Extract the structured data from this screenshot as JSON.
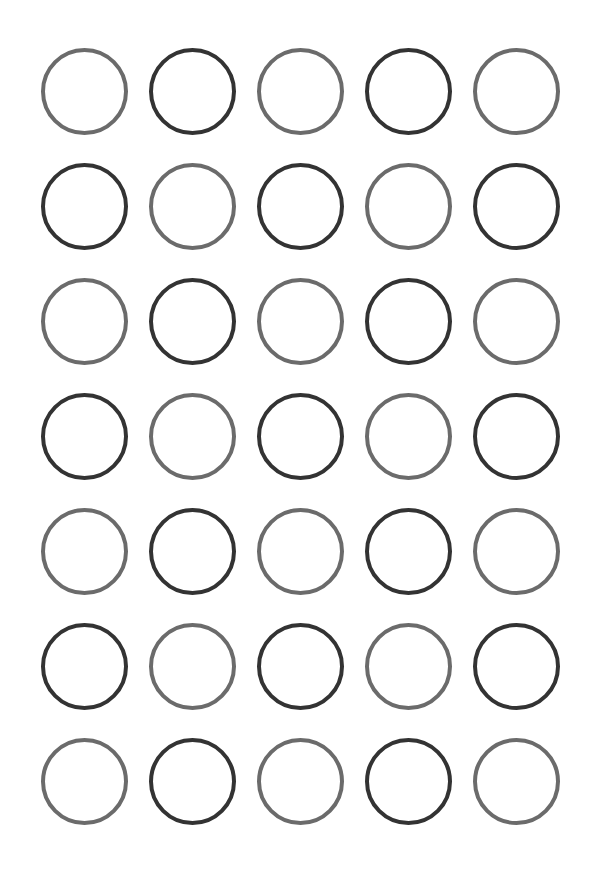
{
  "page": {
    "background_color": "#ffffff",
    "width": 613,
    "height": 878
  },
  "palette": {
    "gray": "#6b6b6b",
    "dark": "#333333",
    "background": "#ffffff"
  },
  "grid": {
    "rows": 7,
    "columns": 5,
    "total_circles": 35,
    "circle_diameter": 87,
    "stroke_width": 4,
    "column_pitch": 108,
    "row_pitch": 115,
    "offset_left": 30,
    "offset_top": 34,
    "pattern_name": "checkerboard-alternating",
    "cells": [
      {
        "row": 1,
        "col": 1,
        "tone": "gray",
        "color": "#6b6b6b",
        "label": "circle-r1c1"
      },
      {
        "row": 1,
        "col": 2,
        "tone": "dark",
        "color": "#333333",
        "label": "circle-r1c2"
      },
      {
        "row": 1,
        "col": 3,
        "tone": "gray",
        "color": "#6b6b6b",
        "label": "circle-r1c3"
      },
      {
        "row": 1,
        "col": 4,
        "tone": "dark",
        "color": "#333333",
        "label": "circle-r1c4"
      },
      {
        "row": 1,
        "col": 5,
        "tone": "gray",
        "color": "#6b6b6b",
        "label": "circle-r1c5"
      },
      {
        "row": 2,
        "col": 1,
        "tone": "dark",
        "color": "#333333",
        "label": "circle-r2c1"
      },
      {
        "row": 2,
        "col": 2,
        "tone": "gray",
        "color": "#6b6b6b",
        "label": "circle-r2c2"
      },
      {
        "row": 2,
        "col": 3,
        "tone": "dark",
        "color": "#333333",
        "label": "circle-r2c3"
      },
      {
        "row": 2,
        "col": 4,
        "tone": "gray",
        "color": "#6b6b6b",
        "label": "circle-r2c4"
      },
      {
        "row": 2,
        "col": 5,
        "tone": "dark",
        "color": "#333333",
        "label": "circle-r2c5"
      },
      {
        "row": 3,
        "col": 1,
        "tone": "gray",
        "color": "#6b6b6b",
        "label": "circle-r3c1"
      },
      {
        "row": 3,
        "col": 2,
        "tone": "dark",
        "color": "#333333",
        "label": "circle-r3c2"
      },
      {
        "row": 3,
        "col": 3,
        "tone": "gray",
        "color": "#6b6b6b",
        "label": "circle-r3c3"
      },
      {
        "row": 3,
        "col": 4,
        "tone": "dark",
        "color": "#333333",
        "label": "circle-r3c4"
      },
      {
        "row": 3,
        "col": 5,
        "tone": "gray",
        "color": "#6b6b6b",
        "label": "circle-r3c5"
      },
      {
        "row": 4,
        "col": 1,
        "tone": "dark",
        "color": "#333333",
        "label": "circle-r4c1"
      },
      {
        "row": 4,
        "col": 2,
        "tone": "gray",
        "color": "#6b6b6b",
        "label": "circle-r4c2"
      },
      {
        "row": 4,
        "col": 3,
        "tone": "dark",
        "color": "#333333",
        "label": "circle-r4c3"
      },
      {
        "row": 4,
        "col": 4,
        "tone": "gray",
        "color": "#6b6b6b",
        "label": "circle-r4c4"
      },
      {
        "row": 4,
        "col": 5,
        "tone": "dark",
        "color": "#333333",
        "label": "circle-r4c5"
      },
      {
        "row": 5,
        "col": 1,
        "tone": "gray",
        "color": "#6b6b6b",
        "label": "circle-r5c1"
      },
      {
        "row": 5,
        "col": 2,
        "tone": "dark",
        "color": "#333333",
        "label": "circle-r5c2"
      },
      {
        "row": 5,
        "col": 3,
        "tone": "gray",
        "color": "#6b6b6b",
        "label": "circle-r5c3"
      },
      {
        "row": 5,
        "col": 4,
        "tone": "dark",
        "color": "#333333",
        "label": "circle-r5c4"
      },
      {
        "row": 5,
        "col": 5,
        "tone": "gray",
        "color": "#6b6b6b",
        "label": "circle-r5c5"
      },
      {
        "row": 6,
        "col": 1,
        "tone": "dark",
        "color": "#333333",
        "label": "circle-r6c1"
      },
      {
        "row": 6,
        "col": 2,
        "tone": "gray",
        "color": "#6b6b6b",
        "label": "circle-r6c2"
      },
      {
        "row": 6,
        "col": 3,
        "tone": "dark",
        "color": "#333333",
        "label": "circle-r6c3"
      },
      {
        "row": 6,
        "col": 4,
        "tone": "gray",
        "color": "#6b6b6b",
        "label": "circle-r6c4"
      },
      {
        "row": 6,
        "col": 5,
        "tone": "dark",
        "color": "#333333",
        "label": "circle-r6c5"
      },
      {
        "row": 7,
        "col": 1,
        "tone": "gray",
        "color": "#6b6b6b",
        "label": "circle-r7c1"
      },
      {
        "row": 7,
        "col": 2,
        "tone": "dark",
        "color": "#333333",
        "label": "circle-r7c2"
      },
      {
        "row": 7,
        "col": 3,
        "tone": "gray",
        "color": "#6b6b6b",
        "label": "circle-r7c3"
      },
      {
        "row": 7,
        "col": 4,
        "tone": "dark",
        "color": "#333333",
        "label": "circle-r7c4"
      },
      {
        "row": 7,
        "col": 5,
        "tone": "gray",
        "color": "#6b6b6b",
        "label": "circle-r7c5"
      }
    ]
  }
}
